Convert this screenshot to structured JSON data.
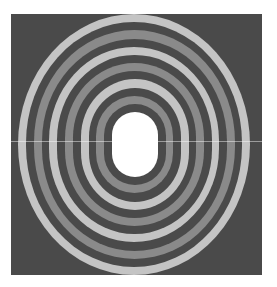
{
  "figure": {
    "colors": {
      "background": "#ffffff",
      "square": "#4a4a4a",
      "light": "#c4c4c4",
      "mid": "#8a8a8a",
      "dark": "#4a4a4a",
      "hole": "#ffffff",
      "line": "#e0e0e0"
    },
    "band_sequence_outer_to_inner": [
      "light",
      "dark",
      "mid",
      "dark",
      "light",
      "dark",
      "mid",
      "dark",
      "light",
      "dark",
      "mid",
      "dark"
    ],
    "outer_bounds": {
      "left": 18,
      "top": 14,
      "right": 250,
      "bottom": 275
    },
    "hole_bounds": {
      "left": 112,
      "top": 112,
      "right": 158,
      "bottom": 177
    }
  }
}
